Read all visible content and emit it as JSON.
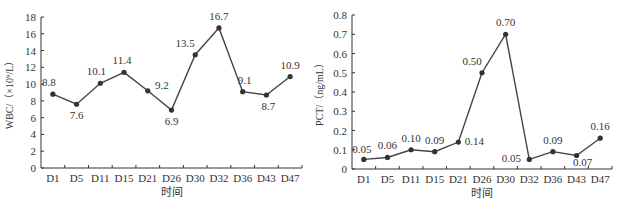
{
  "chart_data": [
    {
      "type": "line",
      "title": "",
      "xlabel": "时间",
      "ylabel": "WBC/（×10⁹/L）",
      "categories": [
        "D1",
        "D5",
        "D11",
        "D15",
        "D21",
        "D26",
        "D30",
        "D32",
        "D36",
        "D43",
        "D47"
      ],
      "values": [
        8.8,
        7.6,
        10.1,
        11.4,
        9.2,
        6.9,
        13.5,
        16.7,
        9.1,
        8.7,
        10.9
      ],
      "data_labels": [
        "8.8",
        "7.6",
        "10.1",
        "11.4",
        "9.2",
        "6.9",
        "13.5",
        "16.7",
        "9.1",
        "8.7",
        "10.9"
      ],
      "yticks": [
        "0",
        "2",
        "4",
        "6",
        "8",
        "10",
        "12",
        "14",
        "16",
        "18"
      ],
      "ylim": [
        0,
        18
      ],
      "grid": false,
      "legend": null
    },
    {
      "type": "line",
      "title": "",
      "xlabel": "时间",
      "ylabel": "PCT/（ng/mL）",
      "categories": [
        "D1",
        "D5",
        "D11",
        "D15",
        "D21",
        "D26",
        "D30",
        "D32",
        "D36",
        "D43",
        "D47"
      ],
      "values": [
        0.05,
        0.06,
        0.1,
        0.09,
        0.14,
        0.5,
        0.7,
        0.05,
        0.09,
        0.07,
        0.16
      ],
      "data_labels": [
        "0.05",
        "0.06",
        "0.10",
        "0.09",
        "0.14",
        "0.50",
        "0.70",
        "0.05",
        "0.09",
        "0.07",
        "0.16"
      ],
      "yticks": [
        "0",
        "0.1",
        "0.2",
        "0.3",
        "0.4",
        "0.5",
        "0.6",
        "0.7",
        "0.8"
      ],
      "ylim": [
        0,
        0.8
      ],
      "grid": false,
      "legend": null
    }
  ]
}
